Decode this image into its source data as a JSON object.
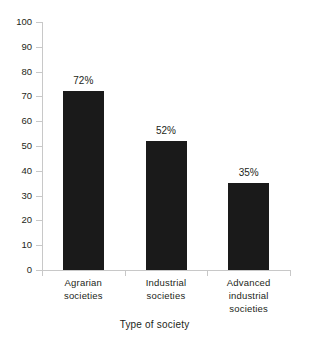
{
  "chart_data": {
    "type": "bar",
    "title": "",
    "subtitle": "",
    "xlabel": "Type of society",
    "ylabel": "",
    "categories": [
      "Agrarian societies",
      "Industrial societies",
      "Advanced industrial societies"
    ],
    "category_lines": [
      [
        "Agrarian",
        "societies"
      ],
      [
        "Industrial",
        "societies"
      ],
      [
        "Advanced",
        "industrial",
        "societies"
      ]
    ],
    "values": [
      72,
      52,
      35
    ],
    "data_labels": [
      "72%",
      "52%",
      "35%"
    ],
    "ylim": [
      0,
      100
    ],
    "ytick_values": [
      0,
      10,
      20,
      30,
      40,
      50,
      60,
      70,
      80,
      90,
      100
    ],
    "ytick_labels": [
      "0",
      "10",
      "20",
      "30",
      "40",
      "50",
      "60",
      "70",
      "80",
      "90",
      "100"
    ],
    "grid": false,
    "legend": null,
    "bar_color": "#1a1a1a",
    "axis_color": "#c8c8c8",
    "background_color": "#ffffff",
    "text_color": "#231f20"
  }
}
